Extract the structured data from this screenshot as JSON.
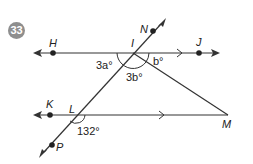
{
  "problem": {
    "number": "33",
    "badge_color": "#8e8e8e"
  },
  "points": {
    "H": "H",
    "I": "I",
    "J": "J",
    "N": "N",
    "K": "K",
    "L": "L",
    "M": "M",
    "P": "P"
  },
  "angles": {
    "angle_HIL": "3a°",
    "angle_LIM": "3b°",
    "angle_MIJ": "b°",
    "angle_KLP_supp": "132°"
  },
  "colors": {
    "line": "#333333",
    "text": "#222222"
  }
}
